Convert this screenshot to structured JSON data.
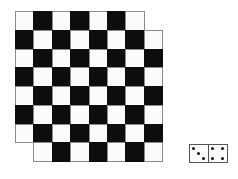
{
  "figure": {
    "title": "",
    "board": {
      "rows": 8,
      "cols": 8,
      "origin_x": 15,
      "origin_y": 11,
      "cell_width": 18.4,
      "cell_height": 18.75,
      "removed_cells": [
        [
          0,
          7
        ],
        [
          7,
          0
        ]
      ],
      "colors": {
        "light": "#fbfbfb",
        "dark": "#0d0d0d",
        "grid_line": "#8a8a8a"
      },
      "light_when_row_plus_col_even": true
    },
    "domino": {
      "left_pips": 3,
      "right_pips": 4,
      "x": 189,
      "y": 144,
      "width": 39,
      "height": 19
    }
  }
}
